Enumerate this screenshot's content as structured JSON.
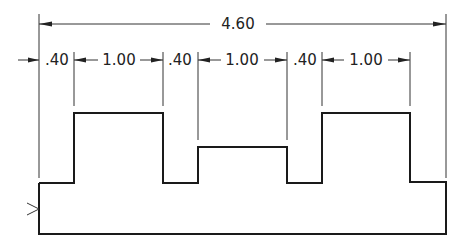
{
  "diagram": {
    "type": "engineering-dimension-drawing",
    "overall_dimension": "4.60",
    "segment_dimensions": [
      ".40",
      "1.00",
      ".40",
      "1.00",
      ".40",
      "1.00"
    ],
    "colors": {
      "line": "#1a1a1a",
      "background": "#ffffff"
    }
  }
}
